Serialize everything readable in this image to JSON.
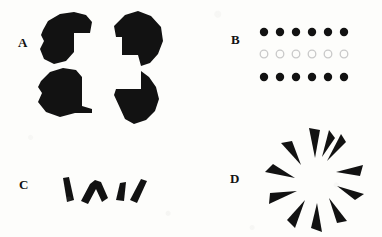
{
  "figure": {
    "background_color": "#fdfdfb",
    "ink_color": "#121212",
    "outline_color": "#c9c9c9",
    "width": 382,
    "height": 237
  },
  "panels": [
    {
      "label": "A",
      "label_x": 18,
      "label_y": 36,
      "stimulus_name": "kanizsa-square-irregular-inducers",
      "inducer_count": 4,
      "inducer_fill": "#121212"
    },
    {
      "label": "B",
      "label_x": 231,
      "label_y": 33,
      "stimulus_name": "dot-row-array",
      "rows": [
        {
          "style": "filled",
          "count": 6,
          "fill": "#121212",
          "y": 35
        },
        {
          "style": "hollow",
          "count": 6,
          "fill": "#fdfdfb",
          "stroke": "#c9c9c9",
          "y": 57
        },
        {
          "style": "filled",
          "count": 6,
          "fill": "#121212",
          "y": 80
        }
      ],
      "dot_diameter": 8,
      "dot_spacing": 16,
      "first_dot_x": 264
    },
    {
      "label": "C",
      "label_x": 19,
      "label_y": 178,
      "stimulus_name": "angular-stroke-fragments",
      "fragment_count": 4,
      "fragment_fill": "#121212"
    },
    {
      "label": "D",
      "label_x": 230,
      "label_y": 172,
      "stimulus_name": "radial-spike-illusory-circle",
      "spike_count": 11,
      "spike_fill": "#121212",
      "center_x": 315,
      "center_y": 180,
      "tip_radius": 20,
      "base_radius": 44
    }
  ]
}
